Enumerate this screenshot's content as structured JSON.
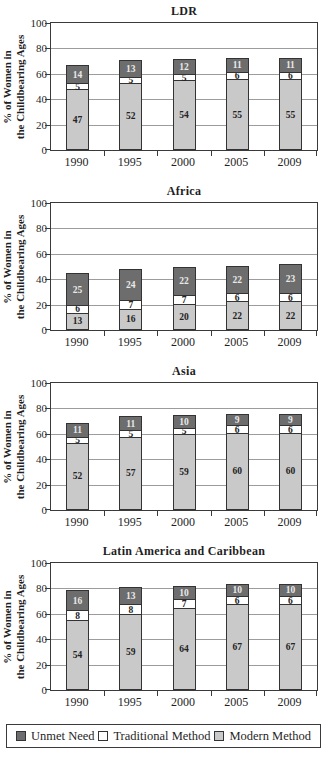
{
  "figure": {
    "y_axis_label_line1": "% of Women in",
    "y_axis_label_line2": "the Childbearing Ages"
  },
  "colors": {
    "unmet": "#6d6d6d",
    "traditional": "#ffffff",
    "modern": "#c9c9c9",
    "bar_border": "#333333",
    "unmet_label_text": "#e9e9e9",
    "dark_label_text": "#222222"
  },
  "legend": {
    "items": [
      {
        "key": "unmet",
        "label": "Unmet Need"
      },
      {
        "key": "traditional",
        "label": "Traditional Method"
      },
      {
        "key": "modern",
        "label": "Modern Method"
      }
    ]
  },
  "chart_data": [
    {
      "type": "bar",
      "stacked": true,
      "title": "LDR",
      "categories": [
        "1990",
        "1995",
        "2000",
        "2005",
        "2009"
      ],
      "series": [
        {
          "name": "Modern Method",
          "key": "modern",
          "values": [
            47,
            52,
            54,
            55,
            55
          ]
        },
        {
          "name": "Traditional Method",
          "key": "traditional",
          "values": [
            5,
            5,
            5,
            6,
            6
          ]
        },
        {
          "name": "Unmet Need",
          "key": "unmet",
          "values": [
            14,
            13,
            12,
            11,
            11
          ]
        }
      ],
      "ylabel": "% of Women in the Childbearing Ages",
      "ylim": [
        0,
        100
      ],
      "yticks": [
        0,
        20,
        40,
        60,
        80,
        100
      ],
      "grid": true,
      "legend_position": "shared-bottom"
    },
    {
      "type": "bar",
      "stacked": true,
      "title": "Africa",
      "categories": [
        "1990",
        "1995",
        "2000",
        "2005",
        "2009"
      ],
      "series": [
        {
          "name": "Modern Method",
          "key": "modern",
          "values": [
            13,
            16,
            20,
            22,
            22
          ]
        },
        {
          "name": "Traditional Method",
          "key": "traditional",
          "values": [
            6,
            7,
            7,
            6,
            6
          ]
        },
        {
          "name": "Unmet Need",
          "key": "unmet",
          "values": [
            25,
            24,
            22,
            22,
            23
          ]
        }
      ],
      "ylabel": "% of Women in the Childbearing Ages",
      "ylim": [
        0,
        100
      ],
      "yticks": [
        0,
        20,
        40,
        60,
        80,
        100
      ],
      "grid": true,
      "legend_position": "shared-bottom"
    },
    {
      "type": "bar",
      "stacked": true,
      "title": "Asia",
      "categories": [
        "1990",
        "1995",
        "2000",
        "2005",
        "2009"
      ],
      "series": [
        {
          "name": "Modern Method",
          "key": "modern",
          "values": [
            52,
            57,
            59,
            60,
            60
          ]
        },
        {
          "name": "Traditional Method",
          "key": "traditional",
          "values": [
            5,
            5,
            5,
            6,
            6
          ]
        },
        {
          "name": "Unmet Need",
          "key": "unmet",
          "values": [
            11,
            11,
            10,
            9,
            9
          ]
        }
      ],
      "ylabel": "% of Women in the Childbearing Ages",
      "ylim": [
        0,
        100
      ],
      "yticks": [
        0,
        20,
        40,
        60,
        80,
        100
      ],
      "grid": true,
      "legend_position": "shared-bottom"
    },
    {
      "type": "bar",
      "stacked": true,
      "title": "Latin America and Caribbean",
      "categories": [
        "1990",
        "1995",
        "2000",
        "2005",
        "2009"
      ],
      "series": [
        {
          "name": "Modern Method",
          "key": "modern",
          "values": [
            54,
            59,
            64,
            67,
            67
          ]
        },
        {
          "name": "Traditional Method",
          "key": "traditional",
          "values": [
            8,
            8,
            7,
            6,
            6
          ]
        },
        {
          "name": "Unmet Need",
          "key": "unmet",
          "values": [
            16,
            13,
            10,
            10,
            10
          ]
        }
      ],
      "ylabel": "% of Women in the Childbearing Ages",
      "ylim": [
        0,
        100
      ],
      "yticks": [
        0,
        20,
        40,
        60,
        80,
        100
      ],
      "grid": true,
      "legend_position": "shared-bottom"
    }
  ]
}
